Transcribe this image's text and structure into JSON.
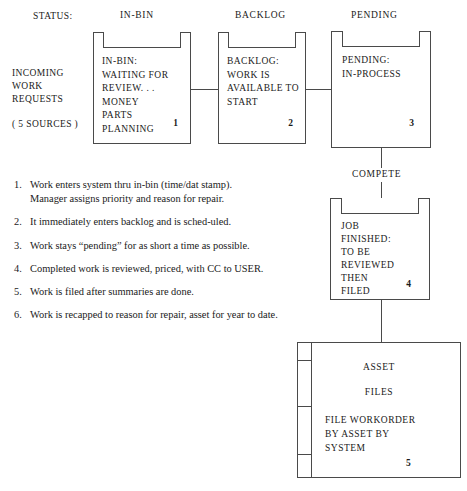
{
  "diagram": {
    "title_row": {
      "status_label": "STATUS:",
      "columns": [
        "IN-BIN",
        "BACKLOG",
        "PENDING"
      ]
    },
    "source_label": {
      "line1": "INCOMING",
      "line2": "WORK",
      "line3": "REQUESTS",
      "line4": "( 5 SOURCES )"
    },
    "compete_label": "COMPETE",
    "boxes": [
      {
        "name": "in-bin",
        "text": "IN-BIN:\nWAITING FOR\nREVIEW. . .\nMONEY\nPARTS\nPLANNING",
        "number": "1"
      },
      {
        "name": "backlog",
        "text": "BACKLOG:\nWORK IS\nAVAILABLE TO\nSTART",
        "number": "2"
      },
      {
        "name": "pending",
        "text": "PENDING:\nIN-PROCESS",
        "number": "3"
      },
      {
        "name": "complete",
        "text": "JOB\nFINISHED:\nTO BE\nREVIEWED\nTHEN\nFILED",
        "number": "4"
      }
    ],
    "asset_files": {
      "heading1": "ASSET",
      "heading2": "FILES",
      "text": "FILE WORKORDER\nBY ASSET BY\nSYSTEM",
      "number": "5"
    }
  },
  "notes": [
    {
      "num": "1.",
      "text": "Work enters system thru in-bin (time/dat stamp).",
      "sub": "Manager assigns priority and reason for repair."
    },
    {
      "num": "2.",
      "text": "It immediately enters backlog and is sched-uled.",
      "sub": ""
    },
    {
      "num": "3.",
      "text": "Work stays “pending” for as short a time as possible.",
      "sub": ""
    },
    {
      "num": "4.",
      "text": "Completed work is reviewed, priced, with CC to USER.",
      "sub": ""
    },
    {
      "num": "5.",
      "text": "Work is filed after summaries are done.",
      "sub": ""
    },
    {
      "num": "6.",
      "text": "Work is recapped to reason for repair, asset for year to date.",
      "sub": ""
    }
  ],
  "colors": {
    "ink": "#1a1a1a",
    "stroke": "#4a4a4a",
    "paper": "#ffffff"
  }
}
